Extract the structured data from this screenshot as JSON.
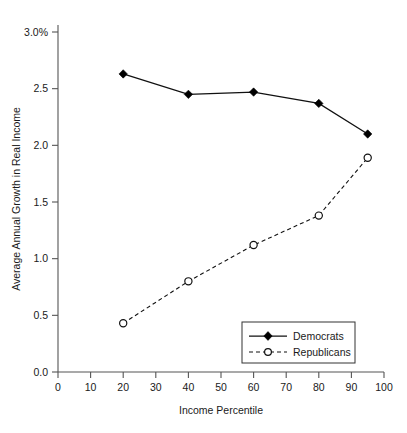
{
  "chart_data": {
    "type": "line",
    "title": "",
    "subtitle": "",
    "xlabel": "Income Percentile",
    "ylabel": "Average Annual Growth in Real Income",
    "xlim": [
      0,
      100
    ],
    "ylim": [
      0.0,
      3.0
    ],
    "grid": false,
    "legend_position": "bottom-right",
    "x": [
      20,
      40,
      60,
      80,
      95
    ],
    "series": [
      {
        "name": "Democrats",
        "values": [
          2.63,
          2.45,
          2.47,
          2.37,
          2.1
        ],
        "marker": "filled-diamond",
        "line_style": "solid"
      },
      {
        "name": "Republicans",
        "values": [
          0.43,
          0.8,
          1.12,
          1.38,
          1.89
        ],
        "marker": "open-circle",
        "line_style": "dashed"
      }
    ],
    "xticks": [
      0,
      10,
      20,
      30,
      40,
      50,
      60,
      70,
      80,
      90,
      100
    ],
    "xtick_labels": [
      "0",
      "10",
      "20",
      "30",
      "40",
      "50",
      "60",
      "70",
      "80",
      "90",
      "100"
    ],
    "yticks": [
      0.0,
      0.5,
      1.0,
      1.5,
      2.0,
      2.5,
      3.0
    ],
    "ytick_labels": [
      "0.0",
      "0.5",
      "1.0",
      "1.5",
      "2.0",
      "2.5",
      "3.0%"
    ],
    "legend_entries": [
      "Democrats",
      "Republicans"
    ],
    "colors": {
      "democrats": "#000000",
      "republicans": "#111111",
      "axis": "#555555",
      "background": "#ffffff"
    }
  }
}
